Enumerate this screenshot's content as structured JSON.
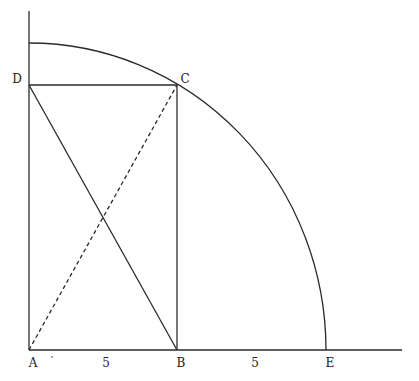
{
  "diagram": {
    "title": "",
    "colors": {
      "stroke": "#2a2a2a",
      "background": "#ffffff",
      "text": "#222222"
    },
    "points": [
      {
        "id": "A",
        "label": "A",
        "x": 29,
        "y": 350,
        "label_x": 33,
        "label_y": 363
      },
      {
        "id": "B",
        "label": "B",
        "x": 177,
        "y": 350,
        "label_x": 181,
        "label_y": 363
      },
      {
        "id": "E",
        "label": "E",
        "x": 326,
        "y": 350,
        "label_x": 330,
        "label_y": 363
      },
      {
        "id": "C",
        "label": "C",
        "x": 177,
        "y": 85,
        "label_x": 185,
        "label_y": 79
      },
      {
        "id": "D",
        "label": "D",
        "x": 29,
        "y": 85,
        "label_x": 17,
        "label_y": 79
      }
    ],
    "segment_labels": [
      {
        "id": "AB",
        "text": "5",
        "x": 106,
        "y": 363
      },
      {
        "id": "BE",
        "text": "5",
        "x": 255,
        "y": 363
      }
    ],
    "axes": {
      "horizontal": {
        "x1": 29,
        "y1": 350,
        "x2": 402,
        "y2": 350
      },
      "vertical": {
        "x1": 29,
        "y1": 350,
        "x2": 29,
        "y2": 11
      }
    },
    "rectangle": {
      "vertices": [
        "A",
        "B",
        "C",
        "D"
      ]
    },
    "solid_segments": [
      {
        "from": "D",
        "to": "B"
      },
      {
        "from": "D",
        "to": "C"
      },
      {
        "from": "B",
        "to": "C"
      }
    ],
    "dashed_segments": [
      {
        "from": "A",
        "to": "C"
      }
    ],
    "arc": {
      "center": "A",
      "rx": 297,
      "ry": 307,
      "from": "E",
      "to_y": 43
    },
    "stray_mark": {
      "x": 52,
      "y": 357
    }
  }
}
